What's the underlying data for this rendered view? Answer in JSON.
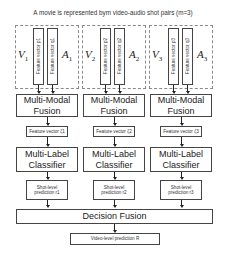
{
  "title": "A movie is represented bym video-audio shot pairs (m=3)",
  "shots": [
    {
      "video_label": "V1",
      "video_sym": "V",
      "video_sub": "1",
      "audio_label": "A1",
      "audio_sym": "A",
      "audio_sub": "1",
      "video_feature": "Feature vector p1",
      "audio_feature": "Feature vector q1",
      "fusion": [
        "Multi-Modal",
        "Fusion"
      ],
      "fused_feature": "Feature vector ζ1",
      "classifier": [
        "Multi-Label",
        "Classifier"
      ],
      "prediction": [
        "Shot-level",
        "prediction r1"
      ]
    },
    {
      "video_label": "V2",
      "video_sym": "V",
      "video_sub": "2",
      "audio_label": "A2",
      "audio_sym": "A",
      "audio_sub": "2",
      "video_feature": "Feature vector p2",
      "audio_feature": "Feature vector q2",
      "fusion": [
        "Multi-Modal",
        "Fusion"
      ],
      "fused_feature": "Feature vector ζ2",
      "classifier": [
        "Multi-Label",
        "Classifier"
      ],
      "prediction": [
        "Shot-level",
        "prediction r2"
      ]
    },
    {
      "video_label": "V3",
      "video_sym": "V",
      "video_sub": "3",
      "audio_label": "A3",
      "audio_sym": "A",
      "audio_sub": "3",
      "video_feature": "Feature vector p3",
      "audio_feature": "Feature vector q3",
      "fusion": [
        "Multi-Modal",
        "Fusion"
      ],
      "fused_feature": "Feature vector ζ3",
      "classifier": [
        "Multi-Label",
        "Classifier"
      ],
      "prediction": [
        "Shot-level",
        "prediction r3"
      ]
    }
  ],
  "decision_fusion": "Decision Fusion",
  "video_prediction": "Video-level prediction R"
}
